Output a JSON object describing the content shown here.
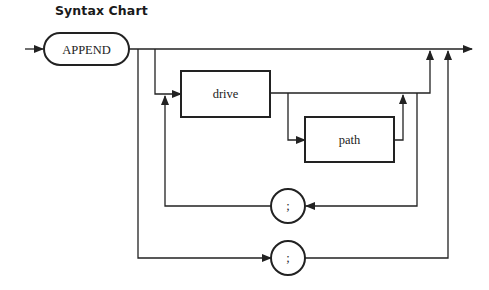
{
  "title": "Syntax Chart",
  "diagram": {
    "type": "railroad-syntax-chart",
    "start_keyword": "APPEND",
    "nodes": [
      {
        "id": "append",
        "label": "APPEND",
        "shape": "rounded-rect"
      },
      {
        "id": "drive",
        "label": "drive",
        "shape": "rect"
      },
      {
        "id": "path",
        "label": "path",
        "shape": "rect"
      },
      {
        "id": "sep1",
        "label": ";",
        "shape": "circle"
      },
      {
        "id": "sep2",
        "label": ";",
        "shape": "circle"
      }
    ],
    "edges": [
      {
        "from": "entry",
        "to": "append"
      },
      {
        "from": "append",
        "to": "exit",
        "note": "bypass"
      },
      {
        "from": "append",
        "to": "drive"
      },
      {
        "from": "drive",
        "to": "exit"
      },
      {
        "from": "drive",
        "to": "path"
      },
      {
        "from": "path",
        "to": "exit"
      },
      {
        "from": "path",
        "to": "sep1",
        "note": "repeat loop"
      },
      {
        "from": "sep1",
        "to": "drive"
      },
      {
        "from": "append",
        "to": "sep2"
      },
      {
        "from": "sep2",
        "to": "exit"
      }
    ]
  },
  "colors": {
    "line": "#222222",
    "background": "#ffffff"
  }
}
